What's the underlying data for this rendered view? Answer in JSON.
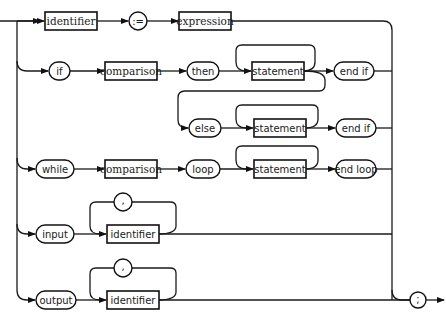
{
  "diagram": {
    "type": "syntax-diagram",
    "title": "statement",
    "nodes": {
      "identifier_1": "identifier",
      "assign": ":=",
      "expression": "expression",
      "if": "if",
      "comparison_1": "comparison",
      "then": "then",
      "statement_1": "statement",
      "end_if_1": "end if",
      "else": "else",
      "statement_2": "statement",
      "end_if_2": "end if",
      "while": "while",
      "comparison_2": "comparison",
      "loop": "loop",
      "statement_3": "statement",
      "end_loop": "end loop",
      "input": "input",
      "comma_1": ",",
      "identifier_2": "identifier",
      "output": "output",
      "comma_2": ",",
      "identifier_3": "identifier",
      "terminator": ";"
    },
    "branches": [
      [
        "identifier",
        ":=",
        "expression"
      ],
      [
        "if",
        "comparison",
        "then",
        "statement+",
        "[else statement+]",
        "end if"
      ],
      [
        "while",
        "comparison",
        "loop",
        "statement+",
        "end loop"
      ],
      [
        "input",
        "identifier {, identifier}"
      ],
      [
        "output",
        "identifier {, identifier}"
      ]
    ],
    "legend": {
      "rectangle": "non-terminal",
      "rounded": "terminal symbol"
    }
  }
}
